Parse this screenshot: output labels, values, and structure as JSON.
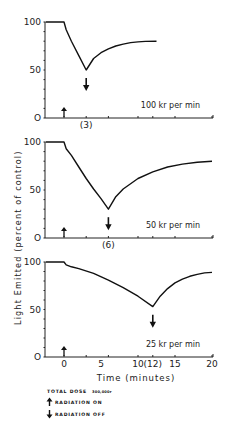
{
  "chart_data": [
    {
      "type": "line",
      "title": "",
      "annotation": "100 kr per min",
      "off_label": "(3)",
      "xlabel": "",
      "ylabel": "Light Emitted (percent of control)",
      "xlim": [
        -2.5,
        20
      ],
      "ylim": [
        0,
        100
      ],
      "yticks": [
        "0",
        "50",
        "100"
      ],
      "xticks": [],
      "radiation_on": 0,
      "radiation_off": 3,
      "x": [
        -2.5,
        0,
        0.3,
        1,
        2,
        3,
        4,
        5,
        6,
        7,
        8,
        9,
        10,
        11,
        12.5
      ],
      "y": [
        100,
        100,
        92,
        80,
        65,
        50,
        62,
        68,
        72,
        75,
        77,
        78.5,
        79.3,
        79.8,
        80
      ]
    },
    {
      "type": "line",
      "title": "",
      "annotation": "50 kr per min",
      "off_label": "(6)",
      "xlabel": "",
      "ylabel": "Light Emitted (percent of control)",
      "xlim": [
        -2.5,
        20
      ],
      "ylim": [
        0,
        100
      ],
      "yticks": [
        "0",
        "50",
        "100"
      ],
      "xticks": [],
      "radiation_on": 0,
      "radiation_off": 6,
      "x": [
        -2.5,
        0,
        0.3,
        1,
        2,
        3,
        4,
        5,
        6,
        7,
        8,
        10,
        12,
        14,
        16,
        18,
        20
      ],
      "y": [
        100,
        100,
        93,
        86,
        74,
        62,
        51,
        41,
        30,
        43,
        51,
        62,
        69,
        74,
        77,
        79,
        80
      ]
    },
    {
      "type": "line",
      "title": "",
      "annotation": "25 kr per min",
      "off_label": "(12)",
      "xlabel": "Time (minutes)",
      "ylabel": "Light Emitted (percent of control)",
      "xlim": [
        -2.5,
        20
      ],
      "ylim": [
        0,
        100
      ],
      "yticks": [
        "0",
        "50",
        "100"
      ],
      "xticks": [
        "0",
        "5",
        "10",
        "(12)",
        "15",
        "20"
      ],
      "xtick_values": [
        0,
        5,
        10,
        12,
        15,
        20
      ],
      "radiation_on": 0,
      "radiation_off": 12,
      "x": [
        -2.5,
        0,
        0.3,
        1,
        2,
        4,
        6,
        8,
        10,
        12,
        13,
        14,
        15,
        16,
        17,
        18,
        19,
        20
      ],
      "y": [
        100,
        100,
        97,
        95,
        93,
        88,
        81,
        73,
        64,
        53,
        64,
        72,
        78,
        82,
        85,
        87,
        88.5,
        89
      ]
    }
  ],
  "legend": {
    "total_dose": "TOTAL DOSE",
    "total_dose_value": "300,000r",
    "radiation_on": "RADIATION ON",
    "radiation_off": "RADIATION OFF"
  },
  "shared": {
    "ylabel": "Light Emitted (percent of control)",
    "xlabel": "Time (minutes)"
  }
}
